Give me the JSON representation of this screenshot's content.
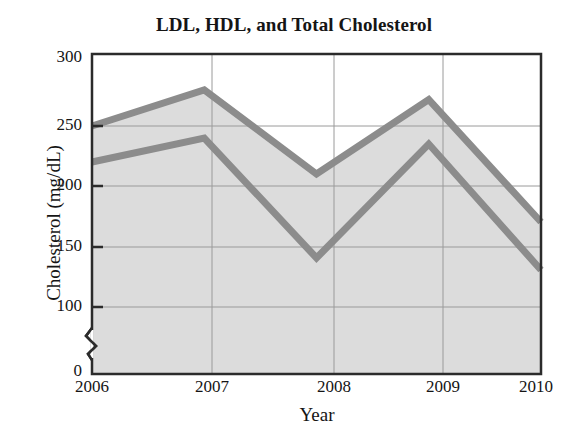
{
  "chart_data": {
    "type": "area",
    "title": "LDL, HDL, and Total Cholesterol",
    "xlabel": "Year",
    "ylabel": "Cholesterol (mg/dL)",
    "categories": [
      "2006",
      "2007",
      "2008",
      "2009",
      "2010"
    ],
    "x": [
      2006,
      2007,
      2008,
      2009,
      2010
    ],
    "series": [
      {
        "name": "LDL",
        "values": [
          220,
          240,
          140,
          235,
          130
        ]
      },
      {
        "name": "Total Cholesterol",
        "values": [
          250,
          280,
          210,
          272,
          170
        ]
      }
    ],
    "annotations": [
      {
        "text": "LDL",
        "x": 2006.7,
        "y": 168
      },
      {
        "text": "HDL",
        "x": 2007.9,
        "y": 190
      }
    ],
    "ylim": [
      0,
      300
    ],
    "y_ticks": [
      0,
      100,
      150,
      200,
      250,
      300
    ],
    "y_tick_labels": [
      "0",
      "100",
      "150",
      "200",
      "250",
      "300"
    ],
    "x_tick_labels": [
      "2006",
      "2007",
      "2008",
      "2009",
      "2010"
    ],
    "axis_break": true,
    "axis_break_between": [
      0,
      100
    ],
    "grid": true,
    "legend": "none",
    "colors": {
      "line": "#8c8c8c",
      "fill": "#dcdcdc",
      "grid": "#9a9a9a",
      "axis": "#2b2b2b",
      "text": "#151515",
      "background": "#ffffff"
    }
  },
  "title": "LDL, HDL, and Total Cholesterol",
  "axes": {
    "y_title": "Cholesterol (mg/dL)",
    "x_title": "Year"
  },
  "y_ticks": [
    {
      "label": "300"
    },
    {
      "label": "250"
    },
    {
      "label": "200"
    },
    {
      "label": "150"
    },
    {
      "label": "100"
    },
    {
      "label": "0"
    }
  ],
  "x_ticks": [
    {
      "label": "2006"
    },
    {
      "label": "2007"
    },
    {
      "label": "2008"
    },
    {
      "label": "2009"
    },
    {
      "label": "2010"
    }
  ],
  "labels": {
    "ldl": "LDL",
    "hdl": "HDL"
  }
}
